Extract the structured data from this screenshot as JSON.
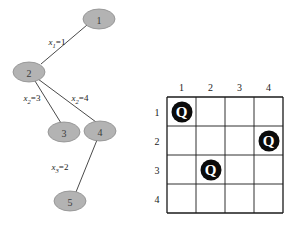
{
  "figure": {
    "background_color": "#ffffff",
    "tree": {
      "node_fill": "#b3b3b3",
      "node_stroke": "#8c8c8c",
      "edge_color": "#4a4a4a",
      "nodes": [
        {
          "id": "1",
          "label": "1",
          "cx": 99,
          "cy": 19,
          "rx": 16,
          "ry": 10
        },
        {
          "id": "2",
          "label": "2",
          "cx": 29,
          "cy": 72,
          "rx": 16,
          "ry": 10
        },
        {
          "id": "3",
          "label": "3",
          "cx": 64,
          "cy": 132,
          "rx": 16,
          "ry": 10
        },
        {
          "id": "4",
          "label": "4",
          "cx": 100,
          "cy": 131,
          "rx": 16,
          "ry": 10
        },
        {
          "id": "5",
          "label": "5",
          "cx": 70,
          "cy": 201,
          "rx": 16,
          "ry": 10
        }
      ],
      "edges": [
        {
          "from": "2",
          "to": "1",
          "x1": 41,
          "y1": 64,
          "x2": 87,
          "y2": 25
        },
        {
          "from": "2",
          "to": "3",
          "x1": 35,
          "y1": 81,
          "x2": 61,
          "y2": 123
        },
        {
          "from": "2",
          "to": "4",
          "x1": 38,
          "y1": 79,
          "x2": 96,
          "y2": 122
        },
        {
          "from": "4",
          "to": "5",
          "x1": 97,
          "y1": 140,
          "x2": 76,
          "y2": 192
        }
      ],
      "edge_labels": [
        {
          "var": "x",
          "sub": "1",
          "eq": "=",
          "val": "1",
          "text": "x1=1",
          "x": 57,
          "y": 43
        },
        {
          "var": "x",
          "sub": "2",
          "eq": "=",
          "val": "3",
          "text": "x2=3",
          "x": 32,
          "y": 99
        },
        {
          "var": "x",
          "sub": "2",
          "eq": "=",
          "val": "4",
          "text": "x2=4",
          "x": 80,
          "y": 99
        },
        {
          "var": "x",
          "sub": "3",
          "eq": "=",
          "val": "2",
          "text": "x3=2",
          "x": 60,
          "y": 168
        }
      ]
    },
    "board": {
      "grid_color": "#1a1a1a",
      "origin_x": 167,
      "origin_y": 97,
      "cell": 29,
      "rows": 4,
      "cols": 4,
      "column_headers": [
        "1",
        "2",
        "3",
        "4"
      ],
      "row_headers": [
        "1",
        "2",
        "3",
        "4"
      ],
      "queen_glyph": "Q",
      "queen_color": "#0b0b0b",
      "queens": [
        {
          "row": 1,
          "col": 1
        },
        {
          "row": 2,
          "col": 4
        },
        {
          "row": 3,
          "col": 2
        }
      ]
    }
  }
}
